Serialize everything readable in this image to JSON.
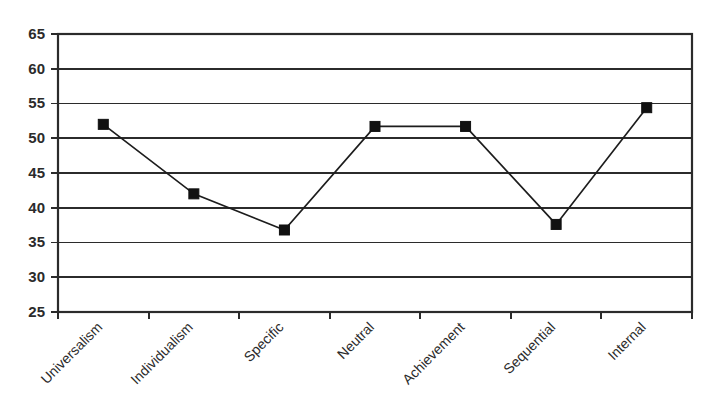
{
  "chart_data": {
    "type": "line",
    "title": "",
    "subtitle": "",
    "xlabel": "",
    "ylabel": "",
    "categories": [
      "Universalism",
      "Individualism",
      "Specific",
      "Neutral",
      "Achievement",
      "Sequential",
      "Internal"
    ],
    "values": [
      52.0,
      42.0,
      36.8,
      51.7,
      51.7,
      37.6,
      54.4
    ],
    "series": [
      {
        "name": "",
        "values": [
          52.0,
          42.0,
          36.8,
          51.7,
          51.7,
          37.6,
          54.4
        ]
      }
    ],
    "ylim": [
      25,
      65
    ],
    "yticks": [
      25,
      30,
      35,
      40,
      45,
      50,
      55,
      60,
      65
    ],
    "ytick_labels": [
      "25",
      "30",
      "35",
      "40",
      "45",
      "50",
      "55",
      "60",
      "65"
    ],
    "grid": "horizontal",
    "legend": "none",
    "marker": "filled-square",
    "marker_color": "#111111",
    "line_color": "#1d1d1d",
    "axis_color": "#2b2b2b",
    "background_color": "#ffffff",
    "xtick_label_rotation": -45,
    "annotations": []
  },
  "axis": {
    "y_labels": [
      "65",
      "60",
      "55",
      "50",
      "45",
      "40",
      "35",
      "30",
      "25"
    ],
    "x_labels": [
      "Universalism",
      "Individualism",
      "Specific",
      "Neutral",
      "Achievement",
      "Sequential",
      "Internal"
    ]
  }
}
